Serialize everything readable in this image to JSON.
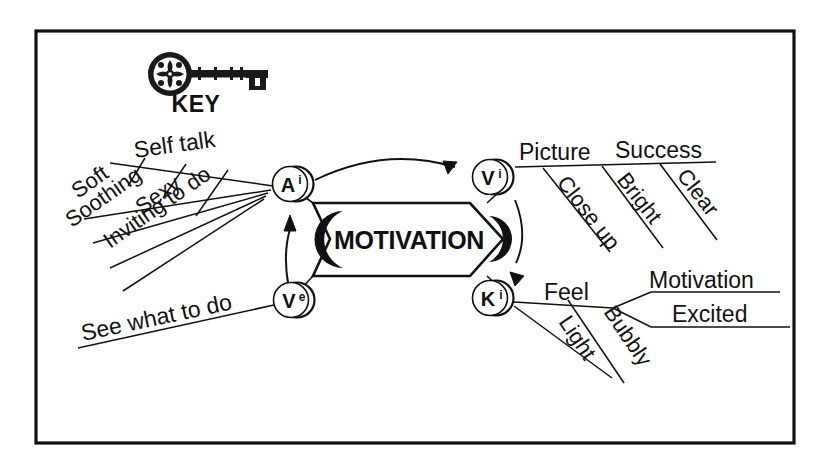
{
  "document": {
    "title": "KEY",
    "type": "mind-map",
    "background_color": "#ffffff",
    "ink_color": "#111111",
    "frame": {
      "present": true,
      "x": 36,
      "y": 31,
      "width": 758,
      "height": 412,
      "stroke_width": 3
    }
  },
  "header": {
    "icon_name": "ornate-skeleton-key-icon",
    "label": "KEY"
  },
  "center": {
    "banner_label": "MOTIVATION",
    "shape": "right-pointing-arrow-banner",
    "crescent_accent": true
  },
  "nodes": [
    {
      "id": "Ai",
      "letter": "A",
      "superscript": "i",
      "label": "Ai",
      "x": 292,
      "y": 184
    },
    {
      "id": "Ve",
      "letter": "V",
      "superscript": "e",
      "label": "Ve",
      "x": 292,
      "y": 300
    },
    {
      "id": "Vi",
      "letter": "V",
      "superscript": "i",
      "label": "Vi",
      "x": 490,
      "y": 177
    },
    {
      "id": "Ki",
      "letter": "K",
      "superscript": "i",
      "label": "Ki",
      "x": 490,
      "y": 298
    }
  ],
  "flow_arrows": [
    {
      "name": "ve-to-ai-arrow",
      "from": "Ve",
      "to": "Ai",
      "style": "straight-up"
    },
    {
      "name": "ai-to-vi-arrow",
      "from": "Ai",
      "to": "Vi",
      "style": "curved-right"
    },
    {
      "name": "vi-to-ki-arrow",
      "from": "Vi",
      "to": "Ki",
      "style": "curved-down"
    }
  ],
  "branches": {
    "Ai": {
      "main": "Self talk",
      "sub": [
        "Soft",
        "Soothing",
        "Sexy",
        "Inviting to do"
      ]
    },
    "Ve": {
      "main": "See what to do",
      "sub": []
    },
    "Vi": {
      "main": "Picture",
      "main_2": "Success",
      "sub": [
        "Close up",
        "Bright",
        "Clear"
      ]
    },
    "Ki": {
      "main": "Feel",
      "sub": [
        "Light",
        "Bubbly"
      ],
      "leaves": [
        "Motivation",
        "Excited"
      ]
    }
  },
  "labels": {
    "self_talk": "Self talk",
    "soft": "Soft",
    "soothing": "Soothing",
    "sexy": "Sexy",
    "inviting_to_do": "Inviting to do",
    "see_what_to_do": "See what to do",
    "picture": "Picture",
    "success": "Success",
    "close_up": "Close up",
    "bright": "Bright",
    "clear": "Clear",
    "feel": "Feel",
    "light": "Light",
    "bubbly": "Bubbly",
    "motivation_leaf": "Motivation",
    "excited": "Excited"
  }
}
